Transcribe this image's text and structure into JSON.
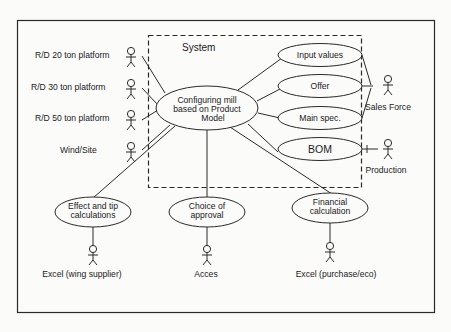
{
  "diagram": {
    "type": "use-case",
    "system": {
      "label": "System"
    },
    "central_use_case": {
      "lines": [
        "Configuring mill",
        "based on Product",
        "Model"
      ]
    },
    "right_use_cases": [
      {
        "id": "input-values",
        "label": "Input values"
      },
      {
        "id": "offer",
        "label": "Offer"
      },
      {
        "id": "main-spec",
        "label": "Main spec."
      },
      {
        "id": "bom",
        "label": "BOM"
      }
    ],
    "bottom_use_cases": [
      {
        "id": "effect-tip",
        "lines": [
          "Effect and tip",
          "calculations"
        ]
      },
      {
        "id": "choice-approval",
        "lines": [
          "Choice of",
          "approval"
        ]
      },
      {
        "id": "financial",
        "lines": [
          "Financial",
          "calculation"
        ]
      }
    ],
    "left_actors": [
      {
        "id": "rd20",
        "label": "R/D 20 ton platform"
      },
      {
        "id": "rd30",
        "label": "R/D 30 ton platform"
      },
      {
        "id": "rd50",
        "label": "R/D 50 ton platform"
      },
      {
        "id": "wind-site",
        "label": "Wind/Site"
      }
    ],
    "right_actors": [
      {
        "id": "sales-force",
        "label": "Sales Force"
      },
      {
        "id": "production",
        "label": "Production"
      }
    ],
    "bottom_actors": [
      {
        "id": "excel-wing",
        "label": "Excel (wing supplier)"
      },
      {
        "id": "acces",
        "label": "Acces"
      },
      {
        "id": "excel-purchase",
        "label": "Excel (purchase/eco)"
      }
    ],
    "colors": {
      "line": "#2a2a2a",
      "background": "#fbfbfa"
    }
  }
}
